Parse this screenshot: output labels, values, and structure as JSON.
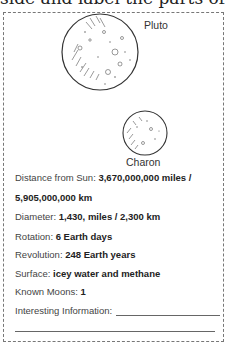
{
  "header": {
    "partial_text": "side and label the parts of the"
  },
  "bodies": [
    {
      "name": "Pluto"
    },
    {
      "name": "Charon"
    }
  ],
  "facts": {
    "distance_label": "Distance from Sun:",
    "distance_value_1": "3,670,000,000 miles /",
    "distance_value_2": "5,905,000,000 km",
    "diameter_label": "Diameter:",
    "diameter_value": "1,430, miles / 2,300 km",
    "rotation_label": "Rotation:",
    "rotation_value": "6 Earth days",
    "revolution_label": "Revolution:",
    "revolution_value": "248 Earth years",
    "surface_label": "Surface:",
    "surface_value": "icey water and methane",
    "moons_label": "Known Moons:",
    "moons_value": "1",
    "interesting_label": "Interesting Information:"
  }
}
